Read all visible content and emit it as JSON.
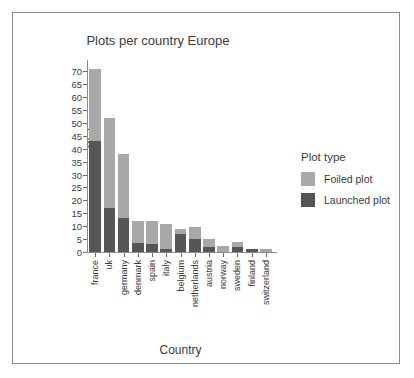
{
  "chart_data": {
    "type": "bar",
    "title": "Plots per country Europe",
    "xlabel": "Country",
    "ylabel": "Plots",
    "ylim": [
      0,
      72
    ],
    "yticks": [
      0,
      5,
      10,
      15,
      20,
      25,
      30,
      35,
      40,
      45,
      50,
      55,
      60,
      65,
      70
    ],
    "grid": false,
    "stacked": true,
    "legend_position": "right",
    "legend_title": "Plot type",
    "categories": [
      "france",
      "uk",
      "germany",
      "denmark",
      "spain",
      "italy",
      "belgium",
      "netherlands",
      "austria",
      "norway",
      "sweden",
      "finland",
      "switzerland"
    ],
    "series": [
      {
        "name": "Launched plot",
        "color": "#565656",
        "values": [
          43,
          17,
          13,
          3.5,
          3,
          1,
          7,
          5,
          2,
          0,
          2,
          1,
          0
        ]
      },
      {
        "name": "Foiled plot",
        "color": "#a8a8a8",
        "values": [
          28,
          35,
          25,
          8.5,
          9,
          10,
          2,
          4.5,
          3,
          2.5,
          2,
          0,
          1
        ]
      }
    ],
    "totals": [
      71,
      52,
      38,
      12,
      12,
      11,
      9,
      9.5,
      5,
      2.5,
      4,
      1,
      1
    ]
  },
  "colors": {
    "foiled": "#a8a8a8",
    "launched": "#565656",
    "axis": "#8c8c8c",
    "text": "#3b3b3b",
    "frame": "#8c8c8c",
    "background": "#ffffff"
  }
}
